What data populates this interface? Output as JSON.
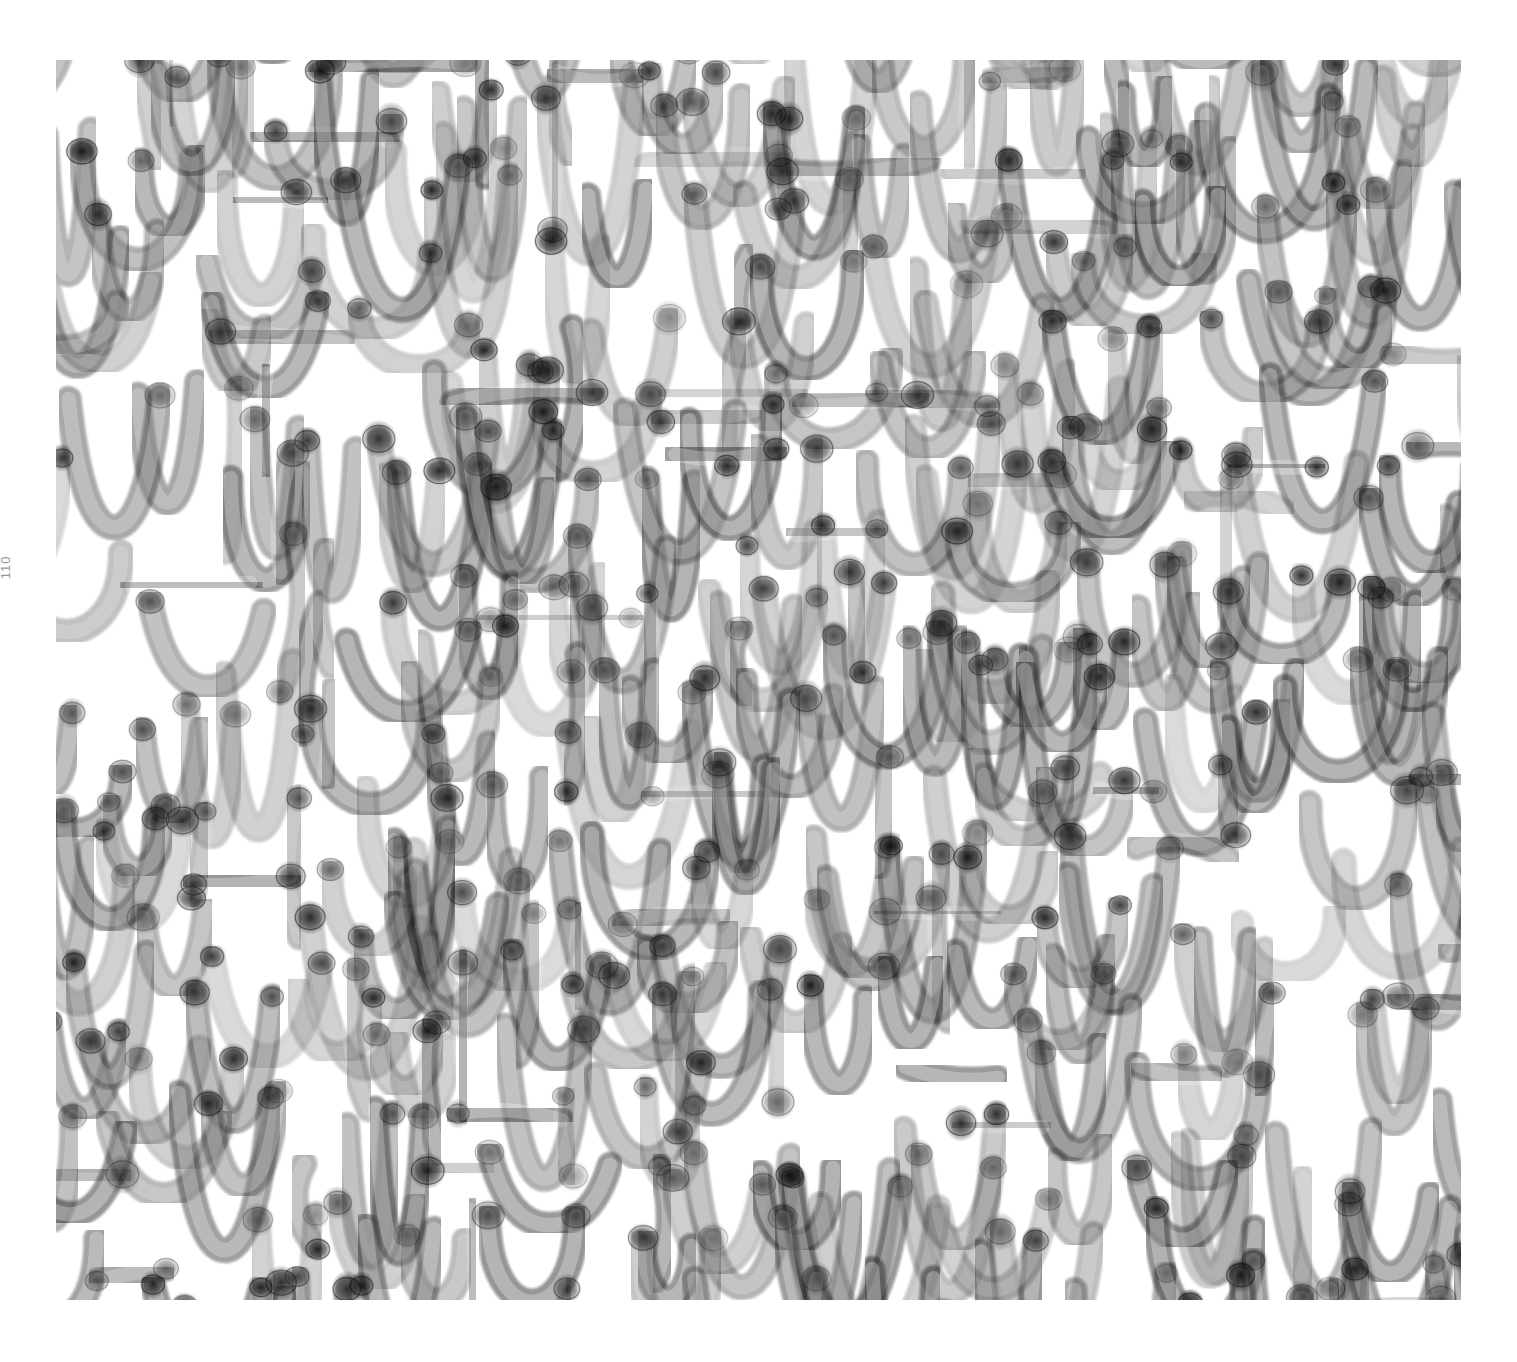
{
  "page": {
    "page_number": "110",
    "background": "#ffffff"
  },
  "artwork": {
    "description": "Abstract grayscale composition of translucent tube-like strokes forming zigzag / V-shaped patterns with darker rounded end caps",
    "ink_color": "#1a1a1a",
    "paper_color": "#ffffff",
    "rows": 11,
    "strokes_per_row": 16,
    "tube_width": 26,
    "seed": 7
  }
}
